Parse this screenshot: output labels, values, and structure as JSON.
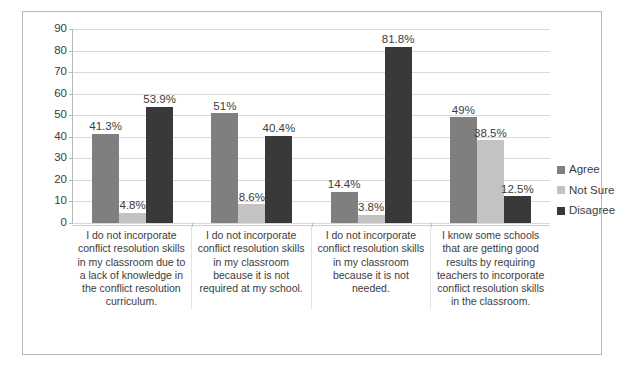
{
  "chart_data": {
    "type": "bar",
    "title": "",
    "xlabel": "",
    "ylabel": "",
    "ylim": [
      0,
      90
    ],
    "yticks": [
      90,
      80,
      70,
      60,
      50,
      40,
      30,
      20,
      10,
      0
    ],
    "grid": true,
    "legend_position": "right",
    "categories": [
      "I do not incorporate conflict resolution skills in my classroom due to a lack of knowledge in the conflict resolution curriculum.",
      "I do not incorporate conflict resolution skills in my classroom because it is not required at my school.",
      "I do not incorporate conflict resolution skills in my classroom because it is not needed.",
      "I know some schools that are getting good results by requiring teachers to incorporate conflict resolution skills in the classroom."
    ],
    "series": [
      {
        "name": "Agree",
        "color": "#7f7f7f",
        "values": [
          41.3,
          51,
          14.4,
          49
        ],
        "labels": [
          "41.3%",
          "51%",
          "14.4%",
          "49%"
        ]
      },
      {
        "name": "Not Sure",
        "color": "#c3c3c3",
        "values": [
          4.8,
          8.6,
          3.8,
          38.5
        ],
        "labels": [
          "4.8%",
          "8.6%",
          "3.8%",
          "38.5%"
        ]
      },
      {
        "name": "Disagree",
        "color": "#393939",
        "values": [
          53.9,
          40.4,
          81.8,
          12.5
        ],
        "labels": [
          "53.9%",
          "40.4%",
          "81.8%",
          "12.5%"
        ]
      }
    ]
  }
}
